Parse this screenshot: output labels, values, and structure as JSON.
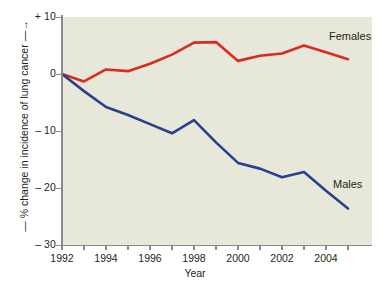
{
  "chart_data": {
    "type": "line",
    "title": "",
    "xlabel": "Year",
    "ylabel": "— % change in incidence of lung cancer —→",
    "x": [
      1992,
      1993,
      1994,
      1995,
      1996,
      1997,
      1998,
      1999,
      2000,
      2001,
      2002,
      2003,
      2004,
      2005
    ],
    "xlim": [
      1992,
      2005
    ],
    "ylim": [
      -30,
      10
    ],
    "yticks": [
      10,
      0,
      -10,
      -20,
      -30
    ],
    "ytick_labels": [
      "+ 10",
      "0",
      "– 10",
      "– 20",
      "– 30"
    ],
    "xticks": [
      1992,
      1993,
      1994,
      1995,
      1996,
      1997,
      1998,
      1999,
      2000,
      2001,
      2002,
      2003,
      2004,
      2005
    ],
    "xtick_labels": [
      "1992",
      "",
      "1994",
      "",
      "1996",
      "",
      "1998",
      "",
      "2000",
      "",
      "2002",
      "",
      "2004",
      ""
    ],
    "grid": false,
    "legend_position": "inline-right",
    "series": [
      {
        "name": "Females",
        "color": "#d92b21",
        "values": [
          0.0,
          -1.3,
          0.8,
          0.5,
          1.8,
          3.4,
          5.5,
          5.6,
          2.3,
          3.2,
          3.6,
          5.0,
          3.8,
          2.6
        ]
      },
      {
        "name": "Males",
        "color": "#2b3f8c",
        "values": [
          0.0,
          -3.0,
          -5.8,
          -7.2,
          -8.8,
          -10.4,
          -8.1,
          -12.0,
          -15.6,
          -16.6,
          -18.1,
          -17.2,
          -20.5,
          -23.6
        ]
      }
    ]
  },
  "axis": {
    "x_title": "Year",
    "y_title": "— % change in incidence of lung cancer —→"
  },
  "labels": {
    "females": "Females",
    "males": "Males"
  },
  "colors": {
    "females_line": "#d92b21",
    "males_line": "#2b3f8c",
    "plot_background": "#e7e8da",
    "axis": "#8a8a8a",
    "text": "#231f20"
  }
}
